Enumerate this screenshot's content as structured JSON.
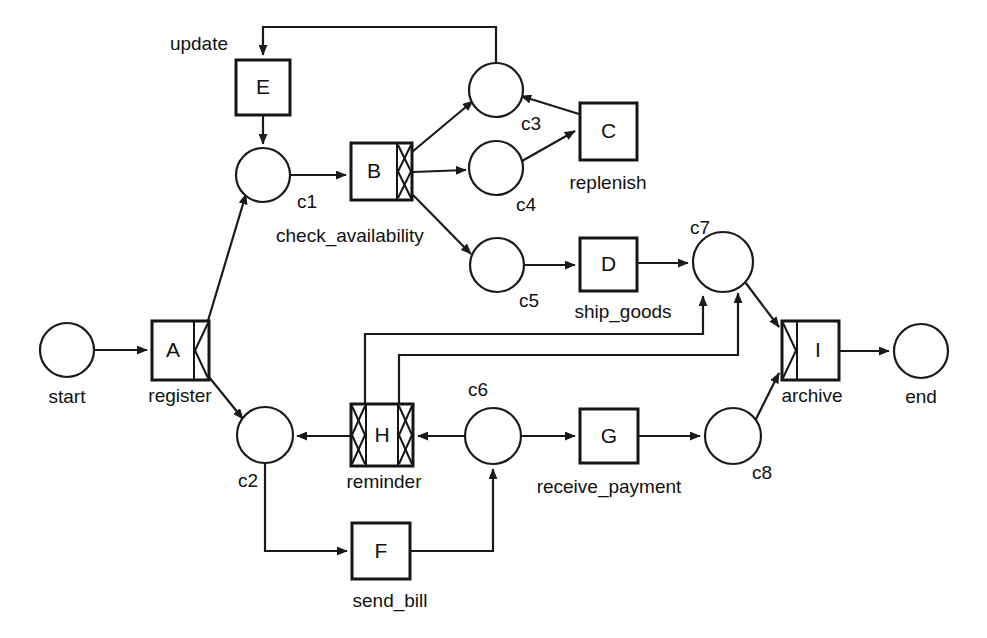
{
  "diagram": {
    "type": "petri-net",
    "title": "",
    "width": 987,
    "height": 638,
    "stroke_color": "#1a1a1a",
    "fill_color": "#ffffff"
  },
  "places": [
    {
      "id": "start",
      "label": "start",
      "cx": 67,
      "cy": 350,
      "r": 27,
      "label_x": 67,
      "label_y": 403,
      "label_anchor": "middle"
    },
    {
      "id": "c1",
      "label": "c1",
      "cx": 263,
      "cy": 175,
      "r": 27,
      "label_x": 297,
      "label_y": 208,
      "label_anchor": "start"
    },
    {
      "id": "c2",
      "label": "c2",
      "cx": 265,
      "cy": 435,
      "r": 28,
      "label_x": 248,
      "label_y": 487,
      "label_anchor": "middle"
    },
    {
      "id": "c3",
      "label": "c3",
      "cx": 496,
      "cy": 90,
      "r": 27,
      "label_x": 521,
      "label_y": 130,
      "label_anchor": "start"
    },
    {
      "id": "c4",
      "label": "c4",
      "cx": 496,
      "cy": 168,
      "r": 27,
      "label_x": 516,
      "label_y": 211,
      "label_anchor": "start"
    },
    {
      "id": "c5",
      "label": "c5",
      "cx": 497,
      "cy": 265,
      "r": 27,
      "label_x": 519,
      "label_y": 307,
      "label_anchor": "start"
    },
    {
      "id": "c6",
      "label": "c6",
      "cx": 493,
      "cy": 436,
      "r": 28,
      "label_x": 478,
      "label_y": 396,
      "label_anchor": "middle"
    },
    {
      "id": "c7",
      "label": "c7",
      "cx": 723,
      "cy": 262,
      "r": 30,
      "label_x": 700,
      "label_y": 234,
      "label_anchor": "middle"
    },
    {
      "id": "c8",
      "label": "c8",
      "cx": 733,
      "cy": 436,
      "r": 28,
      "label_x": 752,
      "label_y": 479,
      "label_anchor": "start"
    },
    {
      "id": "end",
      "label": "end",
      "cx": 921,
      "cy": 351,
      "r": 27,
      "label_x": 921,
      "label_y": 403,
      "label_anchor": "middle"
    }
  ],
  "transitions": [
    {
      "id": "A",
      "letter": "A",
      "label": "register",
      "x": 152,
      "y": 321,
      "w": 57,
      "h": 59,
      "left_marker": "none",
      "right_marker": "and-split",
      "label_x": 180,
      "label_y": 402,
      "label_anchor": "middle"
    },
    {
      "id": "B",
      "letter": "B",
      "label": "check_availability",
      "x": 351,
      "y": 143,
      "w": 61,
      "h": 57,
      "left_marker": "none",
      "right_marker": "xor-split",
      "label_x": 276,
      "label_y": 242,
      "label_anchor": "start"
    },
    {
      "id": "C",
      "letter": "C",
      "label": "replenish",
      "x": 580,
      "y": 103,
      "w": 57,
      "h": 57,
      "left_marker": "none",
      "right_marker": "none",
      "label_x": 608,
      "label_y": 189,
      "label_anchor": "middle"
    },
    {
      "id": "D",
      "letter": "D",
      "label": "ship_goods",
      "x": 580,
      "y": 238,
      "w": 57,
      "h": 53,
      "left_marker": "none",
      "right_marker": "none",
      "label_x": 623,
      "label_y": 318,
      "label_anchor": "middle"
    },
    {
      "id": "E",
      "letter": "E",
      "label": "update",
      "x": 236,
      "y": 60,
      "w": 54,
      "h": 55,
      "left_marker": "none",
      "right_marker": "none",
      "label_x": 228,
      "label_y": 50,
      "label_anchor": "end"
    },
    {
      "id": "F",
      "letter": "F",
      "label": "send_bill",
      "x": 352,
      "y": 523,
      "w": 58,
      "h": 56,
      "left_marker": "none",
      "right_marker": "none",
      "label_x": 390,
      "label_y": 607,
      "label_anchor": "middle"
    },
    {
      "id": "G",
      "letter": "G",
      "label": "receive_payment",
      "x": 580,
      "y": 409,
      "w": 58,
      "h": 54,
      "left_marker": "none",
      "right_marker": "none",
      "label_x": 609,
      "label_y": 493,
      "label_anchor": "middle"
    },
    {
      "id": "H",
      "letter": "H",
      "label": "reminder",
      "x": 351,
      "y": 404,
      "w": 62,
      "h": 62,
      "left_marker": "xor-join",
      "right_marker": "xor-split",
      "label_x": 384,
      "label_y": 488,
      "label_anchor": "middle"
    },
    {
      "id": "I",
      "letter": "I",
      "label": "archive",
      "x": 782,
      "y": 321,
      "w": 57,
      "h": 59,
      "left_marker": "and-join",
      "right_marker": "none",
      "label_x": 812,
      "label_y": 402,
      "label_anchor": "middle"
    }
  ],
  "arcs": [
    {
      "id": "start-to-A",
      "from": "start",
      "to": "A",
      "points": "94,350 147,350",
      "arrow": true
    },
    {
      "id": "A-to-c1",
      "from": "A",
      "to": "c1",
      "points": "207,324 246,194",
      "arrow": true
    },
    {
      "id": "A-to-c2",
      "from": "A",
      "to": "c2",
      "points": "209,377 243,419",
      "arrow": true
    },
    {
      "id": "E-to-c1",
      "from": "E",
      "to": "c1",
      "points": "263,115 263,144",
      "arrow": true
    },
    {
      "id": "c1-to-B",
      "from": "c1",
      "to": "B",
      "points": "290,175 346,175",
      "arrow": true
    },
    {
      "id": "B-to-c3",
      "from": "B",
      "to": "c3",
      "points": "412,152 473,101",
      "arrow": true
    },
    {
      "id": "B-to-c4",
      "from": "B",
      "to": "c4",
      "points": "413,172 466,170",
      "arrow": true
    },
    {
      "id": "B-to-c5",
      "from": "B",
      "to": "c5",
      "points": "413,195 471,254",
      "arrow": true
    },
    {
      "id": "c4-to-C",
      "from": "c4",
      "to": "C",
      "points": "522,161 575,131",
      "arrow": true
    },
    {
      "id": "C-to-c3",
      "from": "C",
      "to": "c3",
      "points": "579,114 521,96",
      "arrow": true
    },
    {
      "id": "c3-to-E",
      "from": "c3",
      "to": "E",
      "points": "496,63 496,27 263,27 263,55",
      "arrow": true
    },
    {
      "id": "c5-to-D",
      "from": "c5",
      "to": "D",
      "points": "524,265 575,265",
      "arrow": true
    },
    {
      "id": "D-to-c7",
      "from": "D",
      "to": "c7",
      "points": "637,263 688,263",
      "arrow": true
    },
    {
      "id": "c7-to-I",
      "from": "c7",
      "to": "I",
      "points": "745,282 779,327",
      "arrow": true
    },
    {
      "id": "c2-to-F",
      "from": "c2",
      "to": "F",
      "points": "265,463 265,551 347,551",
      "arrow": true
    },
    {
      "id": "F-to-c6",
      "from": "F",
      "to": "c6",
      "points": "410,551 493,551 493,469",
      "arrow": true
    },
    {
      "id": "c6-to-H",
      "from": "c6",
      "to": "H",
      "points": "465,436 418,436",
      "arrow": true
    },
    {
      "id": "H-to-c2",
      "from": "H",
      "to": "c2",
      "points": "350,436 297,436",
      "arrow": true
    },
    {
      "id": "H-to-c7-a",
      "from": "H",
      "to": "c7",
      "points": "365,404 365,334 703,334 703,296",
      "arrow": true
    },
    {
      "id": "H-to-c7-b",
      "from": "H",
      "to": "c7",
      "points": "399,404 399,355 738,355 738,293",
      "arrow": true
    },
    {
      "id": "c6-to-G",
      "from": "c6",
      "to": "G",
      "points": "521,436 575,436",
      "arrow": true
    },
    {
      "id": "G-to-c8",
      "from": "G",
      "to": "c8",
      "points": "638,436 700,436",
      "arrow": true
    },
    {
      "id": "c8-to-I",
      "from": "c8",
      "to": "I",
      "points": "755,421 779,373",
      "arrow": true
    },
    {
      "id": "I-to-end",
      "from": "I",
      "to": "end",
      "points": "839,351 889,351",
      "arrow": true
    }
  ],
  "markers": {
    "arrow_size": "11"
  }
}
